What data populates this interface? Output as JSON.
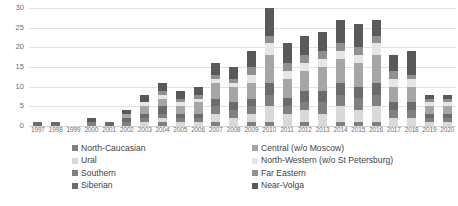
{
  "chart_data": {
    "type": "bar",
    "subtype": "stacked-bar",
    "title": "",
    "xlabel": "",
    "ylabel": "",
    "ylim": [
      0,
      30
    ],
    "y_ticks": [
      0,
      5,
      10,
      15,
      20,
      25,
      30
    ],
    "grid": true,
    "legend_position": "bottom",
    "legend_columns": 2,
    "categories": [
      "1997",
      "1998",
      "1999",
      "2000",
      "2001",
      "2002",
      "2003",
      "2004",
      "2005",
      "2006",
      "2007",
      "2008",
      "2009",
      "2010",
      "2011",
      "2012",
      "2013",
      "2014",
      "2015",
      "2016",
      "2017",
      "2018",
      "2019",
      "2020"
    ],
    "series": [
      {
        "name": "North-Caucasian",
        "color": "#7f7f7f",
        "values": [
          0,
          0,
          0,
          0,
          0,
          0,
          0,
          1,
          0,
          0,
          1,
          0,
          1,
          1,
          0,
          1,
          0,
          1,
          1,
          1,
          0,
          0,
          0,
          0
        ]
      },
      {
        "name": "Ural",
        "color": "#d9d9d9",
        "values": [
          0,
          0,
          0,
          0,
          0,
          0,
          1,
          1,
          1,
          1,
          2,
          2,
          2,
          4,
          3,
          3,
          3,
          4,
          3,
          4,
          2,
          2,
          1,
          1
        ]
      },
      {
        "name": "Southern",
        "color": "#808080",
        "values": [
          0,
          0,
          0,
          1,
          0,
          1,
          1,
          1,
          1,
          1,
          2,
          2,
          2,
          3,
          2,
          2,
          3,
          3,
          3,
          3,
          2,
          2,
          1,
          1
        ]
      },
      {
        "name": "Siberian",
        "color": "#6b6b6b",
        "values": [
          1,
          1,
          0,
          0,
          1,
          1,
          1,
          2,
          1,
          1,
          2,
          2,
          2,
          3,
          2,
          3,
          3,
          3,
          3,
          3,
          2,
          2,
          1,
          1
        ]
      },
      {
        "name": "Central (w/o Moscow)",
        "color": "#a6a6a6",
        "values": [
          0,
          0,
          0,
          0,
          0,
          1,
          2,
          2,
          2,
          3,
          4,
          4,
          4,
          7,
          5,
          5,
          6,
          6,
          6,
          7,
          4,
          4,
          2,
          2
        ]
      },
      {
        "name": "North-Western (w/o St Petersburg)",
        "color": "#e6e6e6",
        "values": [
          0,
          0,
          0,
          0,
          0,
          0,
          1,
          1,
          1,
          1,
          1,
          1,
          2,
          3,
          2,
          2,
          2,
          2,
          2,
          3,
          2,
          2,
          1,
          1
        ]
      },
      {
        "name": "Far Eastern",
        "color": "#909090",
        "values": [
          0,
          0,
          0,
          0,
          0,
          0,
          0,
          1,
          1,
          1,
          1,
          1,
          2,
          2,
          2,
          2,
          2,
          2,
          2,
          2,
          2,
          1,
          1,
          1
        ]
      },
      {
        "name": "Near-Volga",
        "color": "#595959",
        "values": [
          0,
          0,
          0,
          1,
          0,
          1,
          2,
          2,
          2,
          2,
          3,
          3,
          4,
          7,
          5,
          5,
          5,
          6,
          6,
          4,
          4,
          6,
          1,
          1
        ]
      }
    ],
    "totals": [
      1,
      1,
      0,
      2,
      1,
      4,
      8,
      11,
      9,
      10,
      16,
      15,
      19,
      30,
      21,
      23,
      24,
      27,
      26,
      27,
      18,
      19,
      8,
      8
    ]
  },
  "legend": {
    "items": [
      {
        "label": "North-Caucasian",
        "color": "#7f7f7f"
      },
      {
        "label": "Ural",
        "color": "#d9d9d9"
      },
      {
        "label": "Southern",
        "color": "#808080"
      },
      {
        "label": "Siberian",
        "color": "#6b6b6b"
      },
      {
        "label": "Central (w/o Moscow)",
        "color": "#a6a6a6"
      },
      {
        "label": "North-Western (w/o St Petersburg)",
        "color": "#e6e6e6"
      },
      {
        "label": "Far Eastern",
        "color": "#909090"
      },
      {
        "label": "Near-Volga",
        "color": "#595959"
      }
    ]
  }
}
